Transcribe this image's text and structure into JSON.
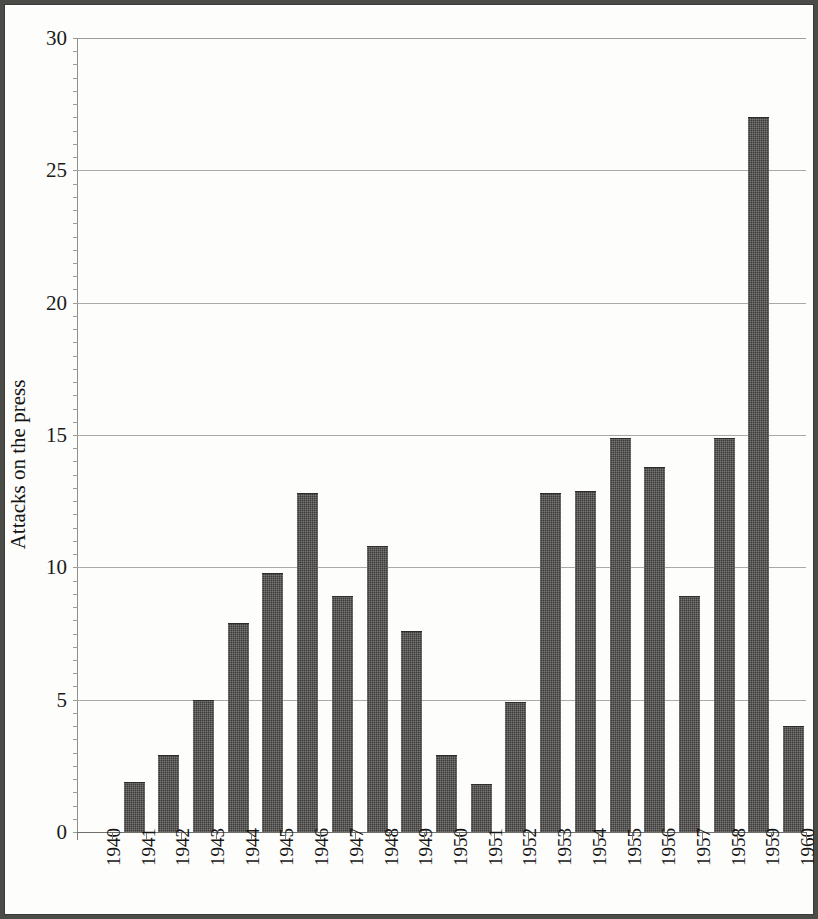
{
  "chart_data": {
    "type": "bar",
    "title": "",
    "xlabel": "",
    "ylabel": "Attacks on the press",
    "ylim": [
      0,
      30
    ],
    "xlim_categories": [
      "1940",
      "1960"
    ],
    "yticks": [
      0,
      5,
      10,
      15,
      20,
      25,
      30
    ],
    "ytick_labels": [
      "0",
      "5",
      "10",
      "15",
      "20",
      "25",
      "30"
    ],
    "grid": true,
    "grid_axis": "y",
    "legend": null,
    "bar_color": "#3c3a38",
    "categories": [
      "1940",
      "1941",
      "1942",
      "1943",
      "1944",
      "1945",
      "1946",
      "1947",
      "1948",
      "1949",
      "1950",
      "1951",
      "1952",
      "1953",
      "1954",
      "1955",
      "1956",
      "1957",
      "1958",
      "1959",
      "1960"
    ],
    "values": [
      0,
      1.9,
      2.9,
      5.0,
      7.9,
      9.8,
      12.8,
      8.9,
      10.8,
      7.6,
      2.9,
      1.8,
      4.9,
      12.8,
      12.9,
      14.9,
      13.8,
      8.9,
      14.9,
      27.0,
      4.0
    ]
  },
  "figure": {
    "background": "#fdfdfb",
    "frame_color": "#4b4b48",
    "gridline_color": "#a9a9a5"
  }
}
